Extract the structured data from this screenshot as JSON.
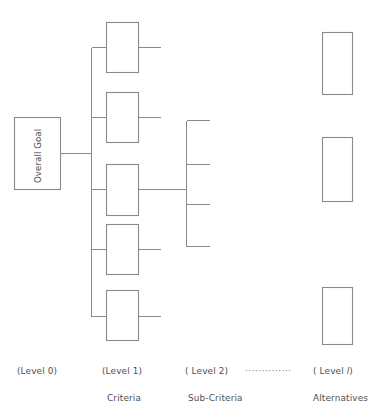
{
  "figure": {
    "type": "hierarchy-diagram",
    "goal_node": {
      "label": "Overall Goal",
      "rotated": "-90deg"
    },
    "level_labels": [
      {
        "name": "level-0",
        "text": "(Level 0)",
        "sublabel": ""
      },
      {
        "name": "level-1",
        "text": "(Level 1)",
        "sublabel": "Criteria"
      },
      {
        "name": "level-2",
        "text": "( Level  2)",
        "sublabel": "Sub-Criteria"
      },
      {
        "name": "level-ellipsis",
        "text": "··············",
        "sublabel": ""
      },
      {
        "name": "level-l",
        "text_before": "( Level  ",
        "text_italic": "l",
        "text_after": ")",
        "sublabel": "Alternatives"
      }
    ],
    "criteria_boxes": [
      {
        "name": "criteria-box-1",
        "x": 106,
        "y": 22,
        "w": 32,
        "h": 50
      },
      {
        "name": "criteria-box-2",
        "x": 106,
        "y": 92,
        "w": 32,
        "h": 50
      },
      {
        "name": "criteria-box-3",
        "x": 106,
        "y": 164,
        "w": 32,
        "h": 51
      },
      {
        "name": "criteria-box-4",
        "x": 106,
        "y": 224,
        "w": 32,
        "h": 50
      },
      {
        "name": "criteria-box-5",
        "x": 106,
        "y": 290,
        "w": 32,
        "h": 50
      }
    ],
    "alternative_boxes": [
      {
        "name": "alternative-box-1",
        "x": 322,
        "y": 32,
        "w": 30,
        "h": 62
      },
      {
        "name": "alternative-box-2",
        "x": 322,
        "y": 137,
        "w": 30,
        "h": 64
      },
      {
        "name": "alternative-box-3",
        "x": 322,
        "y": 287,
        "w": 30,
        "h": 57
      }
    ],
    "subcriteria_bracket": {
      "name": "subcriteria-bracket",
      "spine_x": 186,
      "spine_top": 120,
      "spine_bottom": 246,
      "stub_length": 22,
      "stubs_y": [
        120,
        164,
        204,
        246
      ]
    },
    "colors": {
      "line": "#8a8a8a",
      "box_fill": "#ffffff",
      "text": "#4d4d4d",
      "background": "#ffffff"
    }
  }
}
